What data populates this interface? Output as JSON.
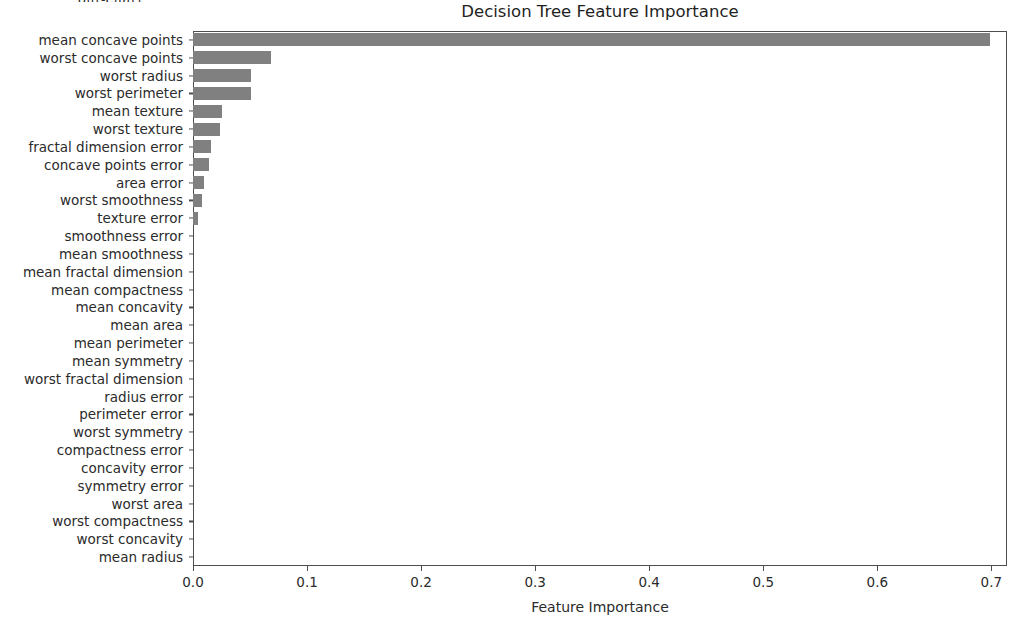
{
  "clipped_top_text": "out-cnart:",
  "chart_data": {
    "type": "bar",
    "orientation": "horizontal",
    "title": "Decision Tree Feature Importance",
    "xlabel": "Feature Importance",
    "ylabel": "",
    "grid": false,
    "legend": null,
    "bar_color": "#808080",
    "frame_color": "#4d4d4d",
    "xlim": [
      0.0,
      0.7137
    ],
    "xticks": [
      0.0,
      0.1,
      0.2,
      0.3,
      0.4,
      0.5,
      0.6,
      0.7
    ],
    "xtick_labels": [
      "0.0",
      "0.1",
      "0.2",
      "0.3",
      "0.4",
      "0.5",
      "0.6",
      "0.7"
    ],
    "categories": [
      "mean concave points",
      "worst concave points",
      "worst radius",
      "worst perimeter",
      "mean texture",
      "worst texture",
      "fractal dimension error",
      "concave points error",
      "area error",
      "worst smoothness",
      "texture error",
      "smoothness error",
      "mean smoothness",
      "mean fractal dimension",
      "mean compactness",
      "mean concavity",
      "mean area",
      "mean perimeter",
      "mean symmetry",
      "worst fractal dimension",
      "radius error",
      "perimeter error",
      "worst symmetry",
      "compactness error",
      "concavity error",
      "symmetry error",
      "worst area",
      "worst compactness",
      "worst concavity",
      "mean radius"
    ],
    "values": [
      0.699,
      0.068,
      0.051,
      0.051,
      0.025,
      0.024,
      0.016,
      0.014,
      0.01,
      0.008,
      0.004,
      0.0,
      0.0,
      0.0,
      0.0,
      0.0,
      0.0,
      0.0,
      0.0,
      0.0,
      0.0,
      0.0,
      0.0,
      0.0,
      0.0,
      0.0,
      0.0,
      0.0,
      0.0,
      0.0
    ]
  }
}
